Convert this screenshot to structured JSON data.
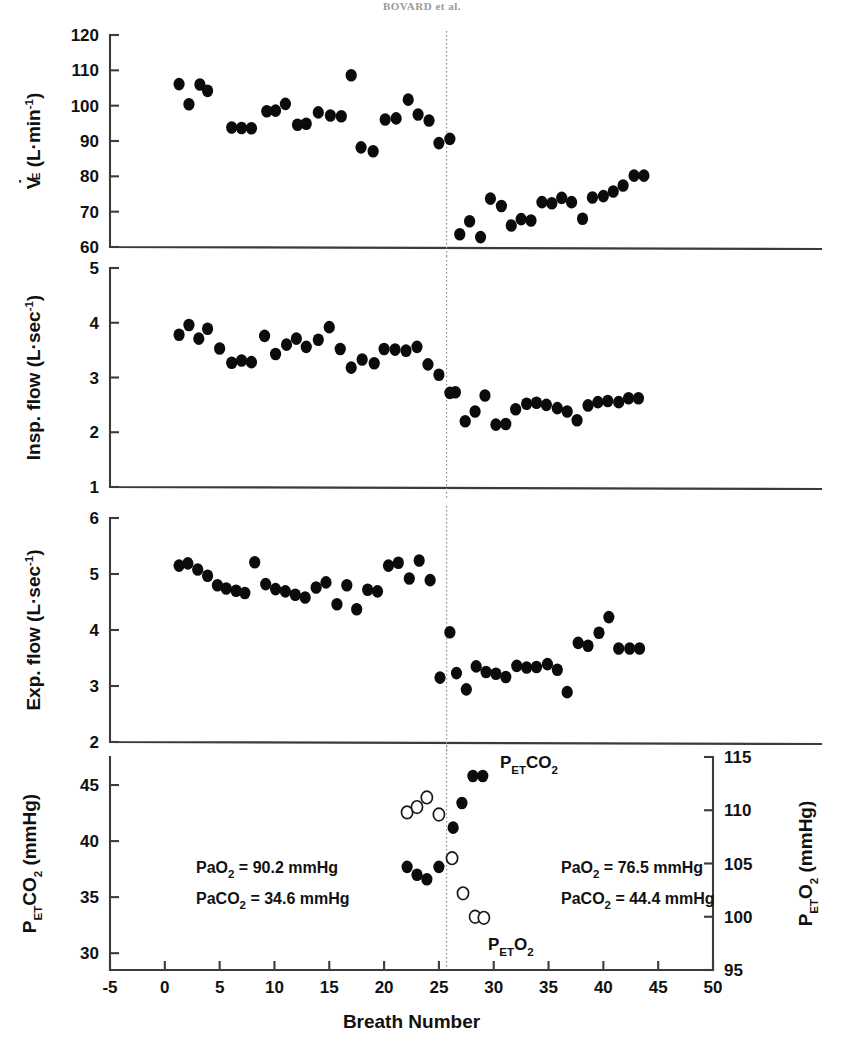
{
  "running_head": "BOVARD et al.",
  "figure": {
    "xaxis": {
      "label": "Breath Number",
      "min": -5,
      "max": 50,
      "ticks": [
        -5,
        0,
        5,
        10,
        15,
        20,
        25,
        30,
        35,
        40,
        45,
        50
      ],
      "tick_labels": [
        "-5",
        "0",
        "5",
        "10",
        "15",
        "20",
        "25",
        "30",
        "35",
        "40",
        "45",
        "50"
      ]
    },
    "divider_x": 25.7,
    "panels": [
      {
        "name": "minute-ventilation",
        "ylabel": "V̇E (L·min-1)",
        "ylabel_parts": {
          "pre": "V",
          "dot": "̇",
          "sub": "E",
          "mid": " (L·min",
          "sup": "-1",
          "post": ")"
        },
        "ymin": 60,
        "ymax": 120,
        "yticks": [
          60,
          70,
          80,
          90,
          100,
          110,
          120
        ],
        "ytick_labels": [
          "60",
          "70",
          "80",
          "90",
          "100",
          "110",
          "120"
        ]
      },
      {
        "name": "inspiratory-flow",
        "ylabel": "Insp. flow (L·sec-1)",
        "ylabel_parts": {
          "pre": "Insp. flow (L·sec",
          "sup": "-1",
          "post": ")"
        },
        "ymin": 1,
        "ymax": 5,
        "yticks": [
          1,
          2,
          3,
          4,
          5
        ],
        "ytick_labels": [
          "1",
          "2",
          "3",
          "4",
          "5"
        ]
      },
      {
        "name": "expiratory-flow",
        "ylabel": "Exp. flow (L·sec-1)",
        "ylabel_parts": {
          "pre": "Exp. flow (L·sec",
          "sup": "-1",
          "post": ")"
        },
        "ymin": 2,
        "ymax": 6,
        "yticks": [
          2,
          3,
          4,
          5,
          6
        ],
        "ytick_labels": [
          "2",
          "3",
          "4",
          "5",
          "6"
        ]
      },
      {
        "name": "end-tidal-gases",
        "ylabel": "PETCO2 (mmHg)",
        "ylabel_parts": {
          "pre": "P",
          "sub": "ET",
          "mid": "CO",
          "sub2": "2",
          "post": " (mmHg)"
        },
        "ymin": 28.5,
        "ymax": 47.5,
        "yticks": [
          30,
          35,
          40,
          45
        ],
        "ytick_labels": [
          "30",
          "35",
          "40",
          "45"
        ],
        "ylabel_right": "PETO2 (mmHg)",
        "ylabel_right_parts": {
          "pre": "P",
          "sub": "ET",
          "mid": "O",
          "sub2": "2",
          "post": " (mmHg)"
        },
        "ymin_right": 95,
        "ymax_right": 115,
        "yticks_right": [
          95,
          100,
          105,
          110,
          115
        ],
        "ytick_labels_right": [
          "95",
          "100",
          "105",
          "110",
          "115"
        ]
      }
    ],
    "annotations": [
      {
        "name": "pao2-pre",
        "line1": "PaO2  = 90.2 mmHg",
        "line2": "PaCO2  = 34.6 mmHg",
        "l1_pre": "PaO",
        "l1_sub": "2",
        "l1_post": "  = 90.2 mmHg",
        "l2_pre": "PaCO",
        "l2_sub": "2",
        "l2_post": "  = 34.6 mmHg",
        "x": 196,
        "y": 873
      },
      {
        "name": "pao2-post",
        "line1": "PaO2  = 76.5 mmHg",
        "line2": "PaCO2  = 44.4 mmHg",
        "l1_pre": "PaO",
        "l1_sub": "2",
        "l1_post": "  = 76.5 mmHg",
        "l2_pre": "PaCO",
        "l2_sub": "2",
        "l2_post": "  = 44.4 mmHg",
        "x": 561,
        "y": 873
      }
    ],
    "series_labels": [
      {
        "name": "petco2-label",
        "pre": "P",
        "sub": "ET",
        "mid": "CO",
        "sub2": "2",
        "x": 500,
        "y": 768
      },
      {
        "name": "peto2-label",
        "pre": "P",
        "sub": "ET",
        "mid": "O",
        "sub2": "2",
        "x": 488,
        "y": 950
      }
    ]
  },
  "chart_data": {
    "type": "scatter",
    "xlabel": "Breath Number",
    "xlim": [
      -5,
      50
    ],
    "grid": false,
    "legend": "none",
    "divider_note": "Vertical dotted line at breath 25.7 marks intervention onset",
    "panels": [
      {
        "id": "minute-ventilation",
        "ylabel": "VE (L/min)",
        "ylim": [
          60,
          120
        ],
        "marker": "filled-circle",
        "x": [
          1.3,
          2.2,
          3.2,
          3.9,
          6.1,
          7.0,
          7.9,
          9.3,
          10.1,
          11.0,
          12.1,
          12.9,
          14.0,
          15.1,
          16.1,
          17.0,
          17.9,
          19.0,
          20.1,
          21.1,
          22.2,
          23.1,
          24.1,
          25.0,
          26.0,
          26.9,
          27.8,
          28.8,
          29.7,
          30.7,
          31.6,
          32.5,
          33.4,
          34.4,
          35.3,
          36.2,
          37.1,
          38.1,
          39.0,
          40.0,
          40.9,
          41.8,
          42.8,
          43.7
        ],
        "y": [
          106.1,
          100.4,
          106.0,
          104.2,
          93.8,
          93.7,
          93.6,
          98.4,
          98.6,
          100.5,
          94.6,
          94.9,
          98.1,
          97.2,
          97.0,
          108.6,
          88.2,
          87.1,
          96.1,
          96.4,
          101.7,
          97.5,
          95.8,
          89.4,
          90.6,
          63.6,
          67.3,
          62.8,
          73.7,
          71.6,
          66.1,
          67.9,
          67.5,
          72.7,
          72.4,
          73.9,
          72.7,
          68.0,
          74.0,
          74.4,
          75.7,
          77.4,
          80.2,
          80.2
        ]
      },
      {
        "id": "inspiratory-flow",
        "ylabel": "Insp. flow (L/sec)",
        "ylim": [
          1,
          5
        ],
        "marker": "filled-circle",
        "x": [
          1.3,
          2.2,
          3.1,
          3.9,
          5.0,
          6.1,
          7.0,
          7.9,
          9.1,
          10.1,
          11.1,
          12.0,
          12.9,
          14.0,
          15.0,
          16.0,
          17.0,
          18.0,
          19.1,
          20.0,
          21.0,
          22.0,
          23.0,
          24.0,
          25.0,
          26.0,
          26.5,
          27.4,
          28.3,
          29.2,
          30.2,
          31.1,
          32.0,
          33.0,
          33.9,
          34.8,
          35.8,
          36.7,
          37.6,
          38.6,
          39.5,
          40.4,
          41.4,
          42.3,
          43.2
        ],
        "y": [
          3.78,
          3.96,
          3.71,
          3.89,
          3.53,
          3.27,
          3.31,
          3.28,
          3.76,
          3.43,
          3.6,
          3.71,
          3.56,
          3.69,
          3.92,
          3.52,
          3.18,
          3.33,
          3.26,
          3.52,
          3.51,
          3.49,
          3.56,
          3.24,
          3.05,
          2.72,
          2.73,
          2.2,
          2.38,
          2.67,
          2.14,
          2.15,
          2.42,
          2.52,
          2.54,
          2.5,
          2.44,
          2.38,
          2.22,
          2.49,
          2.55,
          2.57,
          2.55,
          2.62,
          2.62
        ]
      },
      {
        "id": "expiratory-flow",
        "ylabel": "Exp. flow (L/sec)",
        "ylim": [
          2,
          6
        ],
        "marker": "filled-circle",
        "x": [
          1.3,
          2.1,
          3.0,
          3.9,
          4.8,
          5.6,
          6.5,
          7.3,
          8.2,
          9.2,
          10.1,
          11.0,
          11.9,
          12.8,
          13.8,
          14.7,
          15.7,
          16.6,
          17.5,
          18.5,
          19.4,
          20.4,
          21.3,
          22.3,
          23.2,
          24.2,
          25.1,
          26.0,
          26.6,
          27.5,
          28.4,
          29.3,
          30.2,
          31.1,
          32.1,
          33.0,
          33.9,
          34.9,
          35.8,
          36.7,
          37.7,
          38.6,
          39.6,
          40.5,
          41.4,
          42.4,
          43.3
        ],
        "y": [
          5.15,
          5.19,
          5.08,
          4.97,
          4.8,
          4.74,
          4.7,
          4.66,
          5.21,
          4.82,
          4.73,
          4.69,
          4.63,
          4.58,
          4.76,
          4.85,
          4.46,
          4.8,
          4.37,
          4.72,
          4.69,
          5.15,
          5.2,
          4.92,
          5.24,
          4.89,
          3.15,
          3.96,
          3.23,
          2.94,
          3.35,
          3.25,
          3.22,
          3.16,
          3.36,
          3.33,
          3.34,
          3.39,
          3.29,
          2.89,
          3.77,
          3.72,
          3.95,
          4.23,
          3.67,
          3.67,
          3.67
        ]
      },
      {
        "id": "end-tidal-gases",
        "ylabel_left": "PETCO2 (mmHg)",
        "ylim_left": [
          28.5,
          47.5
        ],
        "ylabel_right": "PETO2 (mmHg)",
        "ylim_right": [
          95,
          115
        ],
        "series": [
          {
            "name": "PETCO2",
            "axis": "left",
            "marker": "filled-circle",
            "x": [
              22.1,
              23.0,
              23.9,
              25.0,
              26.3,
              27.1,
              28.1,
              29.0
            ],
            "y": [
              37.7,
              37.0,
              36.6,
              37.7,
              41.2,
              43.4,
              45.8,
              45.8
            ]
          },
          {
            "name": "PETO2",
            "axis": "right",
            "marker": "open-circle",
            "x": [
              22.1,
              23.0,
              23.9,
              25.0,
              26.2,
              27.2,
              28.3,
              29.1
            ],
            "y": [
              109.8,
              110.3,
              111.2,
              109.6,
              105.5,
              102.2,
              100.0,
              99.9
            ]
          }
        ],
        "annotations": [
          "PaO2 = 90.2 mmHg",
          "PaCO2 = 34.6 mmHg",
          "PaO2 = 76.5 mmHg",
          "PaCO2 = 44.4 mmHg"
        ]
      }
    ]
  }
}
